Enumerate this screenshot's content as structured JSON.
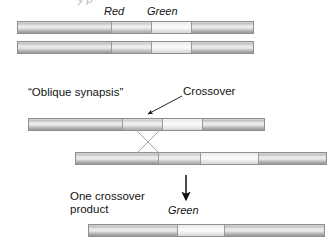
{
  "figure": {
    "type": "diagram",
    "clipped_header": "y p"
  },
  "labels": {
    "red": "Red",
    "green_top": "Green",
    "oblique_synapsis": "“Oblique synapsis”",
    "crossover": "Crossover",
    "one_crossover_product_line1": "One crossover",
    "one_crossover_product_line2": "product",
    "green_bottom": "Green"
  },
  "colors": {
    "ink": "#141414",
    "bar_outline": "#8e8e8e",
    "segment_divider": "#9a9a9a",
    "arrow": "#111111",
    "crossover_line": "#9d9d9d",
    "background": "#ffffff"
  },
  "chromosomes": [
    {
      "id": "top-homolog-1",
      "name": "Top homolog (upper)",
      "segments": [
        {
          "shade": "dark",
          "width_pct": 40,
          "gene": ""
        },
        {
          "shade": "mid",
          "width_pct": 17,
          "gene": "Red"
        },
        {
          "shade": "light",
          "width_pct": 17,
          "gene": "Green"
        },
        {
          "shade": "dark",
          "width_pct": 26,
          "gene": ""
        }
      ]
    },
    {
      "id": "top-homolog-2",
      "name": "Top homolog (lower)",
      "segments": [
        {
          "shade": "dark",
          "width_pct": 40,
          "gene": ""
        },
        {
          "shade": "mid",
          "width_pct": 17,
          "gene": "Red"
        },
        {
          "shade": "light",
          "width_pct": 17,
          "gene": "Green"
        },
        {
          "shade": "dark",
          "width_pct": 26,
          "gene": ""
        }
      ]
    },
    {
      "id": "synapsis-upper",
      "name": "Oblique synapsis upper chromatid",
      "segments": [
        {
          "shade": "dark",
          "width_pct": 40,
          "gene": ""
        },
        {
          "shade": "mid",
          "width_pct": 17,
          "gene": "Red"
        },
        {
          "shade": "light",
          "width_pct": 17,
          "gene": "Green"
        },
        {
          "shade": "dark",
          "width_pct": 26,
          "gene": ""
        }
      ]
    },
    {
      "id": "synapsis-lower",
      "name": "Oblique synapsis lower chromatid",
      "segments": [
        {
          "shade": "dark",
          "width_pct": 33,
          "gene": ""
        },
        {
          "shade": "mid",
          "width_pct": 17,
          "gene": "Red"
        },
        {
          "shade": "light",
          "width_pct": 23,
          "gene": "Green"
        },
        {
          "shade": "dark",
          "width_pct": 27,
          "gene": ""
        }
      ]
    },
    {
      "id": "crossover-product",
      "name": "One crossover product",
      "segments": [
        {
          "shade": "dark",
          "width_pct": 38,
          "gene": ""
        },
        {
          "shade": "light",
          "width_pct": 20,
          "gene": "Green"
        },
        {
          "shade": "dark",
          "width_pct": 42,
          "gene": ""
        }
      ]
    }
  ],
  "annotations": {
    "crossover_arrow": {
      "name": "crossover-pointer",
      "from": [
        183,
        96
      ],
      "to": [
        146,
        115
      ]
    },
    "crossover_x": {
      "name": "crossover-x-lines",
      "top_left": [
        137,
        131
      ],
      "bottom_right": [
        159,
        152
      ],
      "top_right": [
        159,
        131
      ],
      "bottom_left": [
        137,
        152
      ]
    },
    "product_arrow": {
      "name": "product-arrow",
      "from": [
        186,
        175
      ],
      "to": [
        186,
        202
      ]
    }
  }
}
